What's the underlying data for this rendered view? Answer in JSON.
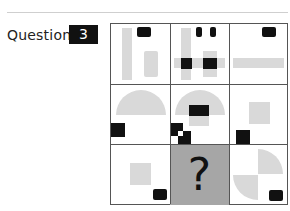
{
  "question": {
    "label": "Question",
    "number": "3"
  },
  "puzzle": {
    "rows": 3,
    "columns": 3,
    "missing_cell": {
      "row": 3,
      "column": 2,
      "symbol": "?"
    },
    "colors": {
      "shape_gray": "#d9d9d9",
      "shape_black": "#111111",
      "missing_cell_bg": "#a6a6a6",
      "grid_line": "#555555"
    },
    "cells": [
      {
        "row": 1,
        "column": 1,
        "description": "tall gray bar, short gray bar, black rounded rect at top"
      },
      {
        "row": 1,
        "column": 2,
        "description": "gray cross of bars with two black squares at intersections, two small black rects at top"
      },
      {
        "row": 1,
        "column": 3,
        "description": "horizontal gray bar, black rounded rect at top right"
      },
      {
        "row": 2,
        "column": 1,
        "description": "gray semicircle, black square at lower left"
      },
      {
        "row": 2,
        "column": 2,
        "description": "gray semicircle with gray square, black rect in center, black checker at lower left"
      },
      {
        "row": 2,
        "column": 3,
        "description": "gray square, black square at lower left"
      },
      {
        "row": 3,
        "column": 1,
        "description": "gray square, black rounded rect at lower right"
      },
      {
        "row": 3,
        "column": 2,
        "description": "missing - question mark"
      },
      {
        "row": 3,
        "column": 3,
        "description": "two gray quarter circles, black rounded rect at lower right"
      }
    ]
  }
}
